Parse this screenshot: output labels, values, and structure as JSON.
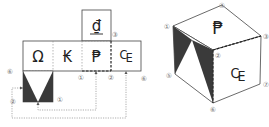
{
  "net": {
    "top_face": {
      "glyph": "₫"
    },
    "row_faces": [
      {
        "glyph": "Ω"
      },
      {
        "glyph": "₭"
      },
      {
        "glyph": "₱"
      },
      {
        "glyph": "₠"
      }
    ],
    "bottom_face": {
      "pattern": "two dark triangles"
    },
    "labels": [
      {
        "text": "⑥",
        "x": 10,
        "y": 71
      },
      {
        "text": "②",
        "x": 13,
        "y": 101
      },
      {
        "text": "①",
        "x": 60,
        "y": 99
      },
      {
        "text": "①",
        "x": 81,
        "y": 77
      },
      {
        "text": "②",
        "x": 111,
        "y": 77
      },
      {
        "text": "③",
        "x": 114,
        "y": 34
      },
      {
        "text": "⑥",
        "x": 143,
        "y": 78
      }
    ]
  },
  "cube": {
    "top_glyph": "₱",
    "front_glyph": "₠",
    "labels": [
      {
        "text": "①",
        "x": 168,
        "y": 26
      },
      {
        "text": "④",
        "x": 222,
        "y": 5
      },
      {
        "text": "③",
        "x": 265,
        "y": 36
      },
      {
        "text": "②",
        "x": 217,
        "y": 55
      },
      {
        "text": "⑤",
        "x": 169,
        "y": 75
      },
      {
        "text": "⑥",
        "x": 213,
        "y": 109
      },
      {
        "text": "⑦",
        "x": 265,
        "y": 84
      }
    ]
  },
  "colors": {
    "line": "#444444",
    "dark": "#3a3a3a",
    "dotted": "#777777",
    "label": "#777777"
  }
}
